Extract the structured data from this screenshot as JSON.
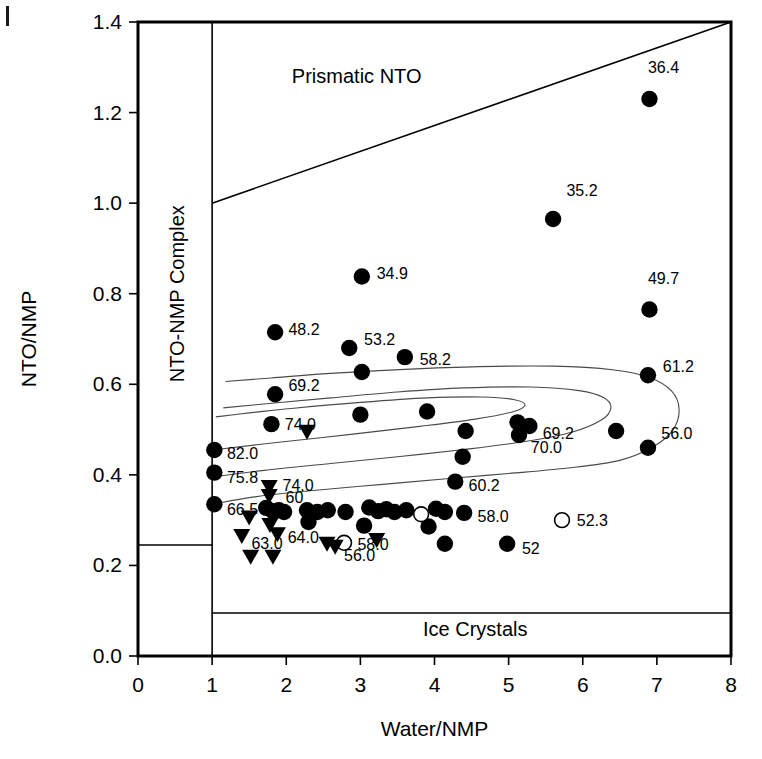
{
  "chart_data": {
    "type": "scatter",
    "title": "",
    "xlabel": "Water/NMP",
    "ylabel": "NTO/NMP",
    "xlim": [
      0,
      8
    ],
    "ylim": [
      0.0,
      1.4
    ],
    "xticks": [
      "0",
      "1",
      "2",
      "3",
      "4",
      "5",
      "6",
      "7",
      "8"
    ],
    "yticks": [
      "0.0",
      "0.2",
      "0.4",
      "0.6",
      "0.8",
      "1.0",
      "1.2",
      "1.4"
    ],
    "grid": false,
    "legend_position": "none",
    "region_labels": [
      {
        "text": "Prismatic NTO",
        "x": 2.95,
        "y": 1.265
      },
      {
        "text": "NTO-NMP Complex",
        "x": 0.62,
        "y": 0.8,
        "rotation": -90
      },
      {
        "text": "Ice Crystals",
        "x": 4.55,
        "y": 0.045
      }
    ],
    "boundaries": [
      {
        "name": "prismatic-nto-boundary",
        "type": "line",
        "points": [
          [
            1.0,
            1.0
          ],
          [
            8.0,
            1.4
          ]
        ]
      },
      {
        "name": "complex-vertical-boundary",
        "type": "line",
        "points": [
          [
            1.0,
            0.0
          ],
          [
            1.0,
            1.4
          ]
        ]
      },
      {
        "name": "ice-crystals-boundary",
        "type": "line",
        "points": [
          [
            1.0,
            0.095
          ],
          [
            8.0,
            0.095
          ]
        ]
      },
      {
        "name": "left-box-divider",
        "type": "line",
        "points": [
          [
            0.0,
            0.245
          ],
          [
            1.0,
            0.245
          ]
        ]
      }
    ],
    "contours": [
      {
        "name": "contour-outer",
        "points": [
          [
            1.0,
            0.335
          ],
          [
            1.6,
            0.352
          ],
          [
            2.4,
            0.366
          ],
          [
            3.3,
            0.379
          ],
          [
            4.2,
            0.392
          ],
          [
            5.0,
            0.403
          ],
          [
            5.8,
            0.415
          ],
          [
            6.5,
            0.432
          ],
          [
            6.95,
            0.462
          ],
          [
            7.22,
            0.5
          ],
          [
            7.3,
            0.545
          ],
          [
            7.2,
            0.585
          ],
          [
            6.9,
            0.615
          ],
          [
            6.4,
            0.632
          ],
          [
            5.6,
            0.64
          ],
          [
            4.6,
            0.639
          ],
          [
            3.6,
            0.633
          ],
          [
            2.6,
            0.624
          ],
          [
            1.8,
            0.614
          ],
          [
            1.18,
            0.606
          ]
        ]
      },
      {
        "name": "contour-mid",
        "points": [
          [
            1.0,
            0.395
          ],
          [
            1.7,
            0.41
          ],
          [
            2.6,
            0.425
          ],
          [
            3.5,
            0.44
          ],
          [
            4.4,
            0.456
          ],
          [
            5.2,
            0.473
          ],
          [
            5.85,
            0.494
          ],
          [
            6.25,
            0.521
          ],
          [
            6.38,
            0.548
          ],
          [
            6.28,
            0.571
          ],
          [
            5.95,
            0.586
          ],
          [
            5.3,
            0.594
          ],
          [
            4.4,
            0.592
          ],
          [
            3.5,
            0.583
          ],
          [
            2.6,
            0.57
          ],
          [
            1.8,
            0.558
          ],
          [
            1.15,
            0.548
          ]
        ]
      },
      {
        "name": "contour-inner",
        "points": [
          [
            1.0,
            0.455
          ],
          [
            1.9,
            0.472
          ],
          [
            2.9,
            0.49
          ],
          [
            3.8,
            0.507
          ],
          [
            4.55,
            0.523
          ],
          [
            5.05,
            0.539
          ],
          [
            5.22,
            0.554
          ],
          [
            5.08,
            0.566
          ],
          [
            4.65,
            0.572
          ],
          [
            3.9,
            0.57
          ],
          [
            3.0,
            0.56
          ],
          [
            2.1,
            0.547
          ],
          [
            1.4,
            0.535
          ],
          [
            1.05,
            0.528
          ]
        ]
      }
    ],
    "series": [
      {
        "name": "filled-circles",
        "marker": "filled-circle",
        "points": [
          {
            "x": 6.9,
            "y": 1.23,
            "label": "36.4",
            "lx": 6.88,
            "ly": 1.3
          },
          {
            "x": 5.6,
            "y": 0.965,
            "label": "35.2",
            "lx": 5.78,
            "ly": 1.03
          },
          {
            "x": 6.9,
            "y": 0.765,
            "label": "49.7",
            "lx": 6.88,
            "ly": 0.835
          },
          {
            "x": 3.02,
            "y": 0.838,
            "label": "34.9",
            "lx": 3.22,
            "ly": 0.845
          },
          {
            "x": 1.85,
            "y": 0.715,
            "label": "48.2",
            "lx": 2.03,
            "ly": 0.722
          },
          {
            "x": 2.85,
            "y": 0.68,
            "label": "53.2",
            "lx": 3.05,
            "ly": 0.7
          },
          {
            "x": 3.6,
            "y": 0.66,
            "label": "58.2",
            "lx": 3.8,
            "ly": 0.655
          },
          {
            "x": 3.02,
            "y": 0.627,
            "label": "",
            "lx": 0,
            "ly": 0
          },
          {
            "x": 6.88,
            "y": 0.62,
            "label": "61.2",
            "lx": 7.08,
            "ly": 0.64
          },
          {
            "x": 1.85,
            "y": 0.578,
            "label": "69.2",
            "lx": 2.03,
            "ly": 0.598
          },
          {
            "x": 1.8,
            "y": 0.512,
            "label": "74.0",
            "lx": 1.98,
            "ly": 0.512
          },
          {
            "x": 3.0,
            "y": 0.533,
            "label": "",
            "lx": 0,
            "ly": 0
          },
          {
            "x": 3.9,
            "y": 0.54,
            "label": "",
            "lx": 0,
            "ly": 0
          },
          {
            "x": 5.12,
            "y": 0.516,
            "label": "",
            "lx": 0,
            "ly": 0
          },
          {
            "x": 5.28,
            "y": 0.508,
            "label": "69.2",
            "lx": 5.46,
            "ly": 0.492
          },
          {
            "x": 6.45,
            "y": 0.497,
            "label": "",
            "lx": 0,
            "ly": 0
          },
          {
            "x": 4.42,
            "y": 0.497,
            "label": "",
            "lx": 0,
            "ly": 0
          },
          {
            "x": 5.14,
            "y": 0.488,
            "label": "70.0",
            "lx": 5.3,
            "ly": 0.462
          },
          {
            "x": 6.88,
            "y": 0.46,
            "label": "56.0",
            "lx": 7.06,
            "ly": 0.492
          },
          {
            "x": 1.03,
            "y": 0.455,
            "label": "82.0",
            "lx": 1.2,
            "ly": 0.448
          },
          {
            "x": 4.38,
            "y": 0.44,
            "label": "",
            "lx": 0,
            "ly": 0
          },
          {
            "x": 1.03,
            "y": 0.405,
            "label": "75.8",
            "lx": 1.2,
            "ly": 0.396
          },
          {
            "x": 4.28,
            "y": 0.385,
            "label": "60.2",
            "lx": 4.46,
            "ly": 0.378
          },
          {
            "x": 1.03,
            "y": 0.335,
            "label": "66.5",
            "lx": 1.2,
            "ly": 0.325
          },
          {
            "x": 1.73,
            "y": 0.327,
            "label": "",
            "lx": 0,
            "ly": 0
          },
          {
            "x": 1.82,
            "y": 0.32,
            "label": "",
            "lx": 0,
            "ly": 0
          },
          {
            "x": 1.9,
            "y": 0.322,
            "label": "",
            "lx": 0,
            "ly": 0
          },
          {
            "x": 1.97,
            "y": 0.318,
            "label": "",
            "lx": 0,
            "ly": 0
          },
          {
            "x": 2.28,
            "y": 0.322,
            "label": "",
            "lx": 0,
            "ly": 0
          },
          {
            "x": 2.42,
            "y": 0.318,
            "label": "",
            "lx": 0,
            "ly": 0
          },
          {
            "x": 2.56,
            "y": 0.322,
            "label": "",
            "lx": 0,
            "ly": 0
          },
          {
            "x": 2.8,
            "y": 0.318,
            "label": "",
            "lx": 0,
            "ly": 0
          },
          {
            "x": 3.12,
            "y": 0.328,
            "label": "",
            "lx": 0,
            "ly": 0
          },
          {
            "x": 3.24,
            "y": 0.32,
            "label": "",
            "lx": 0,
            "ly": 0
          },
          {
            "x": 3.35,
            "y": 0.324,
            "label": "",
            "lx": 0,
            "ly": 0
          },
          {
            "x": 3.46,
            "y": 0.318,
            "label": "",
            "lx": 0,
            "ly": 0
          },
          {
            "x": 3.62,
            "y": 0.322,
            "label": "",
            "lx": 0,
            "ly": 0
          },
          {
            "x": 4.02,
            "y": 0.325,
            "label": "",
            "lx": 0,
            "ly": 0
          },
          {
            "x": 4.14,
            "y": 0.318,
            "label": "",
            "lx": 0,
            "ly": 0
          },
          {
            "x": 4.4,
            "y": 0.316,
            "label": "58.0",
            "lx": 4.58,
            "ly": 0.31
          },
          {
            "x": 2.3,
            "y": 0.296,
            "label": "",
            "lx": 0,
            "ly": 0
          },
          {
            "x": 3.05,
            "y": 0.288,
            "label": "",
            "lx": 0,
            "ly": 0
          },
          {
            "x": 3.92,
            "y": 0.286,
            "label": "",
            "lx": 0,
            "ly": 0
          },
          {
            "x": 4.14,
            "y": 0.248,
            "label": "",
            "lx": 0,
            "ly": 0
          },
          {
            "x": 4.98,
            "y": 0.248,
            "label": "52",
            "lx": 5.18,
            "ly": 0.238
          }
        ]
      },
      {
        "name": "open-circles",
        "marker": "open-circle",
        "points": [
          {
            "x": 5.72,
            "y": 0.3,
            "label": "52.3",
            "lx": 5.92,
            "ly": 0.3
          },
          {
            "x": 3.82,
            "y": 0.313,
            "label": "",
            "lx": 0,
            "ly": 0
          },
          {
            "x": 2.78,
            "y": 0.25,
            "label": "58.0",
            "lx": 2.96,
            "ly": 0.248
          }
        ]
      },
      {
        "name": "filled-triangles",
        "marker": "filled-triangle-down",
        "points": [
          {
            "x": 2.28,
            "y": 0.494,
            "label": "",
            "lx": 0,
            "ly": 0
          },
          {
            "x": 1.77,
            "y": 0.372,
            "label": "74.0",
            "lx": 1.95,
            "ly": 0.378
          },
          {
            "x": 1.77,
            "y": 0.352,
            "label": "60",
            "lx": 1.99,
            "ly": 0.352
          },
          {
            "x": 1.5,
            "y": 0.305,
            "label": "",
            "lx": 0,
            "ly": 0
          },
          {
            "x": 1.78,
            "y": 0.288,
            "label": "",
            "lx": 0,
            "ly": 0
          },
          {
            "x": 1.4,
            "y": 0.264,
            "label": "63.0",
            "lx": 1.53,
            "ly": 0.25
          },
          {
            "x": 1.88,
            "y": 0.268,
            "label": "64.0",
            "lx": 2.02,
            "ly": 0.262
          },
          {
            "x": 2.55,
            "y": 0.247,
            "label": "",
            "lx": 0,
            "ly": 0
          },
          {
            "x": 2.66,
            "y": 0.24,
            "label": "56.0",
            "lx": 2.78,
            "ly": 0.222
          },
          {
            "x": 1.52,
            "y": 0.218,
            "label": "",
            "lx": 0,
            "ly": 0
          },
          {
            "x": 1.82,
            "y": 0.218,
            "label": "",
            "lx": 0,
            "ly": 0
          },
          {
            "x": 3.22,
            "y": 0.255,
            "label": "",
            "lx": 0,
            "ly": 0
          }
        ]
      }
    ]
  }
}
